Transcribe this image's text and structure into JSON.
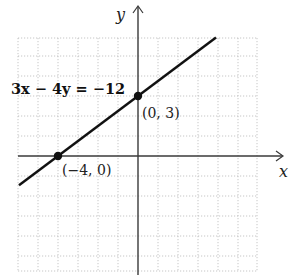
{
  "chart_data": {
    "type": "line",
    "title": "",
    "xlabel": "x",
    "ylabel": "y",
    "xlim": [
      -6,
      6
    ],
    "ylim": [
      -5.75,
      5.9
    ],
    "grid": true,
    "grid_step": 1,
    "series": [
      {
        "name": "3x − 4y = −12",
        "equation": "3x - 4y = -12",
        "slope": 0.75,
        "intercept": 3,
        "x_range": [
          -5.95,
          3.9
        ]
      }
    ],
    "points": [
      {
        "x": -4,
        "y": 0,
        "label": "(−4, 0)"
      },
      {
        "x": 0,
        "y": 3,
        "label": "(0, 3)"
      }
    ],
    "annotation": "3x − 4y = −12"
  }
}
